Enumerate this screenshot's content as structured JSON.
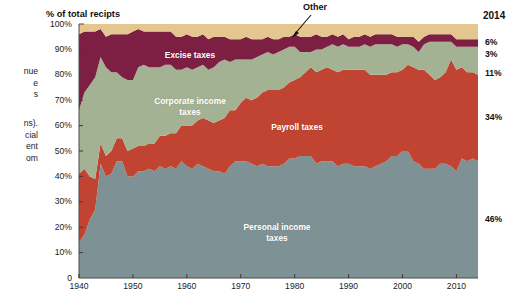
{
  "side_article": {
    "heading_fragment": "s in",
    "body_fragment_1": "nue\ne\ns",
    "body_fragment_2": "ns).\ncial\nent\nom"
  },
  "chart_data": {
    "type": "area",
    "stacked": true,
    "title": "",
    "axis_note": "% of total recipts",
    "xlabel": "",
    "ylabel": "% of total recipts",
    "xlim": [
      1940,
      2014
    ],
    "ylim": [
      0,
      100
    ],
    "grid": false,
    "legend_position": "in-plot",
    "end_year_label": "2014",
    "x_ticks": [
      "1940",
      "1950",
      "1960",
      "1970",
      "1980",
      "1990",
      "2000",
      "2010"
    ],
    "y_ticks": [
      "100%",
      "90%",
      "80%",
      "70%",
      "60%",
      "50%",
      "40%",
      "30%",
      "20%",
      "10%",
      "0"
    ],
    "end_values": [
      {
        "series": "Other",
        "value": "6%"
      },
      {
        "series": "Excise taxes",
        "value": "3%"
      },
      {
        "series": "Corporate income taxes",
        "value": "11%"
      },
      {
        "series": "Payroll taxes",
        "value": "34%"
      },
      {
        "series": "Personal income taxes",
        "value": "46%"
      }
    ],
    "annotations": [
      {
        "text": "Other",
        "target": "top tan band",
        "arrow": "down-left"
      }
    ],
    "colors": {
      "other": "#E5C68F",
      "excise": "#7C1F42",
      "corporate": "#A3B292",
      "payroll": "#C04431",
      "personal": "#7E9194",
      "background": "#FFFFFF",
      "text": "#1A1A1A"
    },
    "x": [
      1940,
      1941,
      1942,
      1943,
      1944,
      1945,
      1946,
      1947,
      1948,
      1949,
      1950,
      1951,
      1952,
      1953,
      1954,
      1955,
      1956,
      1957,
      1958,
      1959,
      1960,
      1961,
      1962,
      1963,
      1964,
      1965,
      1966,
      1967,
      1968,
      1969,
      1970,
      1971,
      1972,
      1973,
      1974,
      1975,
      1976,
      1977,
      1978,
      1979,
      1980,
      1981,
      1982,
      1983,
      1984,
      1985,
      1986,
      1987,
      1988,
      1989,
      1990,
      1991,
      1992,
      1993,
      1994,
      1995,
      1996,
      1997,
      1998,
      1999,
      2000,
      2001,
      2002,
      2003,
      2004,
      2005,
      2006,
      2007,
      2008,
      2009,
      2010,
      2011,
      2012,
      2013,
      2014
    ],
    "series": [
      {
        "name": "Personal income taxes",
        "color": "#7E9194",
        "label_text": "Personal income\ntaxes",
        "values": [
          14,
          17,
          23,
          27,
          45,
          40,
          41,
          46,
          46,
          40,
          40,
          42,
          42,
          43,
          42,
          44,
          43,
          44,
          43,
          46,
          44,
          43,
          45,
          44,
          43,
          42,
          42,
          41,
          44,
          46,
          46,
          46,
          45,
          44,
          45,
          44,
          44,
          44,
          45,
          47,
          47,
          48,
          48,
          48,
          45,
          46,
          46,
          46,
          44,
          45,
          45,
          44,
          44,
          44,
          43,
          44,
          45,
          46,
          48,
          48,
          50,
          50,
          46,
          45,
          43,
          43,
          43,
          45,
          45,
          44,
          42,
          47,
          46,
          47,
          46
        ],
        "end_value": 46
      },
      {
        "name": "Payroll taxes",
        "color": "#C04431",
        "label_text": "Payroll taxes",
        "values": [
          27,
          26,
          17,
          12,
          8,
          8,
          9,
          9,
          9,
          10,
          11,
          10,
          10,
          10,
          11,
          12,
          13,
          13,
          14,
          14,
          16,
          17,
          17,
          19,
          19,
          19,
          20,
          22,
          22,
          20,
          23,
          25,
          25,
          27,
          28,
          30,
          30,
          30,
          30,
          30,
          31,
          31,
          33,
          35,
          36,
          36,
          37,
          36,
          37,
          37,
          37,
          38,
          38,
          38,
          37,
          36,
          35,
          34,
          33,
          33,
          32,
          34,
          37,
          37,
          39,
          37,
          35,
          34,
          36,
          42,
          40,
          36,
          35,
          34,
          34
        ],
        "end_value": 34
      },
      {
        "name": "Corporate income taxes",
        "color": "#A3B292",
        "label_text": "Corporate income\ntaxes",
        "values": [
          25,
          30,
          36,
          40,
          34,
          35,
          31,
          26,
          24,
          28,
          27,
          31,
          32,
          30,
          30,
          27,
          28,
          27,
          25,
          22,
          23,
          22,
          21,
          21,
          20,
          22,
          23,
          23,
          19,
          20,
          17,
          15,
          16,
          16,
          15,
          15,
          14,
          15,
          15,
          14,
          13,
          10,
          8,
          6,
          9,
          8,
          8,
          10,
          10,
          10,
          9,
          9,
          9,
          10,
          11,
          12,
          12,
          12,
          11,
          10,
          10,
          8,
          8,
          7,
          10,
          13,
          15,
          14,
          12,
          7,
          9,
          8,
          10,
          10,
          11
        ],
        "end_value": 11
      },
      {
        "name": "Excise taxes",
        "color": "#7C1F42",
        "label_text": "Excise taxes",
        "values": [
          30,
          24,
          21,
          18,
          11,
          12,
          15,
          15,
          17,
          18,
          19,
          15,
          13,
          14,
          14,
          14,
          13,
          13,
          13,
          13,
          13,
          13,
          12,
          12,
          12,
          12,
          10,
          9,
          9,
          8,
          8,
          9,
          8,
          7,
          6,
          6,
          6,
          5,
          5,
          4,
          5,
          6,
          6,
          6,
          6,
          5,
          4,
          4,
          4,
          4,
          3,
          4,
          4,
          4,
          4,
          4,
          4,
          4,
          4,
          4,
          3,
          3,
          4,
          4,
          3,
          3,
          3,
          3,
          3,
          3,
          3,
          3,
          3,
          3,
          3
        ],
        "end_value": 3
      },
      {
        "name": "Other",
        "color": "#E5C68F",
        "label_text": "Other",
        "values": [
          4,
          3,
          3,
          3,
          2,
          5,
          4,
          4,
          4,
          4,
          3,
          2,
          3,
          3,
          3,
          3,
          3,
          3,
          5,
          5,
          4,
          5,
          5,
          4,
          6,
          5,
          5,
          5,
          6,
          6,
          6,
          5,
          6,
          6,
          6,
          5,
          6,
          6,
          5,
          5,
          4,
          5,
          5,
          5,
          4,
          5,
          5,
          4,
          5,
          4,
          6,
          5,
          5,
          4,
          5,
          4,
          4,
          4,
          4,
          5,
          5,
          5,
          5,
          7,
          5,
          4,
          4,
          4,
          4,
          4,
          6,
          6,
          6,
          6,
          6
        ],
        "end_value": 6
      }
    ]
  }
}
